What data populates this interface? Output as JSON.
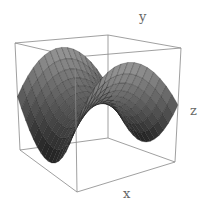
{
  "chart_data": {
    "type": "surface3d",
    "title": "",
    "function": "z = x^2 - y^2 (saddle)",
    "xlabel": "x",
    "ylabel": "y",
    "zlabel": "z",
    "grid": false,
    "box": true,
    "mesh_lines": true,
    "colors": {
      "surface_light": "#9a9a9a",
      "surface_dark": "#1e1e1e",
      "mesh": "#111111",
      "box": "#888888",
      "label": "#666666"
    }
  },
  "labels": {
    "x": "x",
    "y": "y",
    "z": "z"
  }
}
